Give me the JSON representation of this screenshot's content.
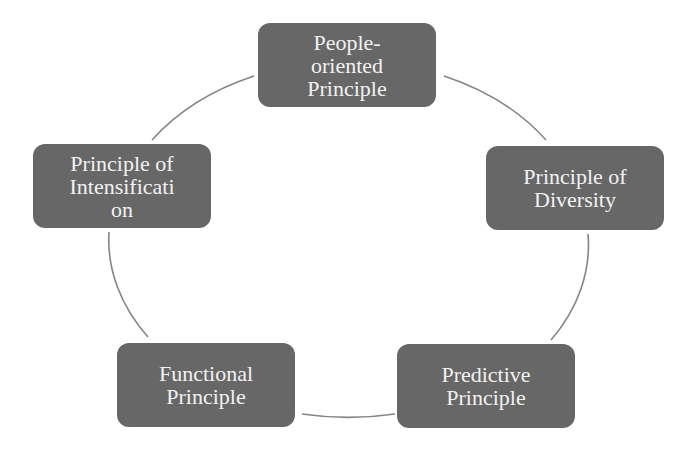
{
  "diagram": {
    "type": "cycle",
    "colors": {
      "node_fill": "#676767",
      "node_text": "#f2f2f2",
      "ring_stroke": "#858585",
      "background": "#ffffff"
    },
    "nodes": [
      {
        "id": "people-oriented",
        "label": "People-\noriented\nPrinciple"
      },
      {
        "id": "diversity",
        "label": "Principle of\nDiversity"
      },
      {
        "id": "predictive",
        "label": "Predictive\nPrinciple"
      },
      {
        "id": "functional",
        "label": "Functional\nPrinciple"
      },
      {
        "id": "intensification",
        "label": "Principle of\nIntensificati\non"
      }
    ]
  }
}
